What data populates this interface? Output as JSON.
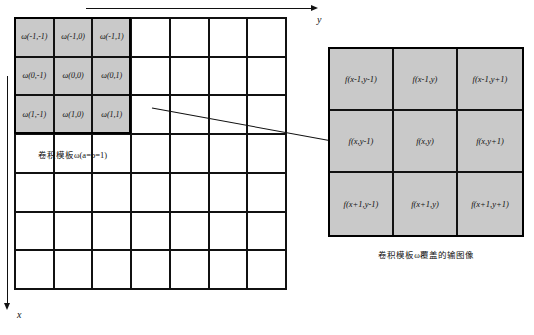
{
  "figure": {
    "axes": {
      "horizontal_label": "y",
      "vertical_label": "x"
    },
    "left_panel": {
      "name": "convolution-mask-grid",
      "columns": 7,
      "rows": 7,
      "caption_prefix": "卷积模板",
      "caption_symbol": "ω",
      "caption_suffix": "(a=b=1)",
      "caption_full": "卷积模板ω(a=b=1)",
      "mask_rows": [
        [
          "ω(-1,-1)",
          "ω(-1,0)",
          "ω(-1,1)"
        ],
        [
          "ω(0,-1)",
          "ω(0,0)",
          "ω(0,1)"
        ],
        [
          "ω(1,-1)",
          "ω(1,0)",
          "ω(1,1)"
        ]
      ]
    },
    "right_panel": {
      "name": "covered-image-neighborhood",
      "columns": 3,
      "rows": 3,
      "caption_prefix": "卷积模板",
      "caption_symbol": "ω",
      "caption_suffix": "覆盖的输图像",
      "caption_full": "卷积模板ω覆盖的输图像",
      "value_rows": [
        [
          "f(x-1,y-1)",
          "f(x-1,y)",
          "f(x-1,y+1)"
        ],
        [
          "f(x,y-1)",
          "f(x,y)",
          "f(x,y+1)"
        ],
        [
          "f(x+1,y-1)",
          "f(x+1,y)",
          "f(x+1,y+1)"
        ]
      ]
    },
    "colors": {
      "shaded_cell": "#c9c9c9",
      "grid_line": "#111111",
      "background": "#ffffff"
    }
  }
}
